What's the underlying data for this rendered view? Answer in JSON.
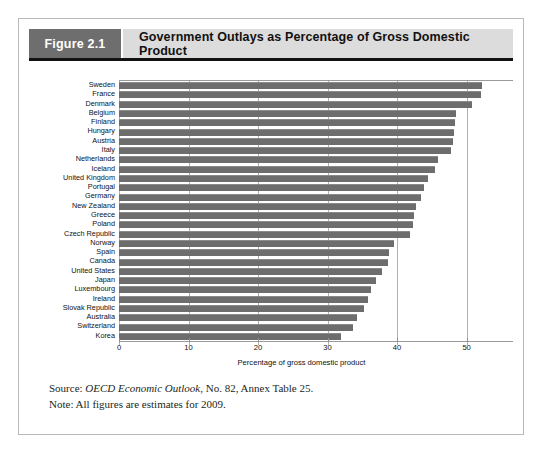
{
  "figure": {
    "number_label": "Figure 2.1",
    "title": "Government Outlays as Percentage of Gross Domestic Product",
    "source_prefix": "Source: ",
    "source_italic": "OECD Economic Outlook",
    "source_suffix": ", No. 82, Annex Table 25.",
    "note": "Note: All figures are estimates for 2009."
  },
  "colors": {
    "bar_fill": "#6d6d6d",
    "header_number_bg": "#6e6e6e",
    "header_title_bg": "#dcdcdc",
    "frame_border": "#b9b9b9",
    "gridline": "#b0b0b0"
  },
  "chart_data": {
    "type": "bar",
    "orientation": "horizontal",
    "title": "Government Outlays as Percentage of Gross Domestic Product",
    "xlabel": "Percentage of gross domestic product",
    "ylabel": "",
    "xlim": [
      0,
      52.5
    ],
    "xticks": [
      0,
      10,
      20,
      30,
      40,
      50
    ],
    "xtick_labels": [
      "0",
      "10",
      "20",
      "30",
      "40",
      "50"
    ],
    "grid": true,
    "legend": "none",
    "categories": [
      "Sweden",
      "France",
      "Denmark",
      "Belgium",
      "Finland",
      "Hungary",
      "Austria",
      "Italy",
      "Netherlands",
      "Iceland",
      "United Kingdom",
      "Portugal",
      "Germany",
      "New Zealand",
      "Greece",
      "Poland",
      "Czech Republic",
      "Norway",
      "Spain",
      "Canada",
      "United States",
      "Japan",
      "Luxembourg",
      "Ireland",
      "Slovak Republic",
      "Australia",
      "Switzerland",
      "Korea"
    ],
    "values": [
      52.2,
      52.0,
      50.8,
      48.5,
      48.3,
      48.2,
      48.0,
      47.8,
      45.9,
      45.4,
      44.5,
      43.9,
      43.5,
      42.7,
      42.5,
      42.3,
      41.9,
      39.5,
      38.8,
      38.7,
      37.9,
      36.9,
      36.3,
      35.8,
      35.2,
      34.2,
      33.6,
      31.9
    ],
    "units": "percent of GDP"
  }
}
